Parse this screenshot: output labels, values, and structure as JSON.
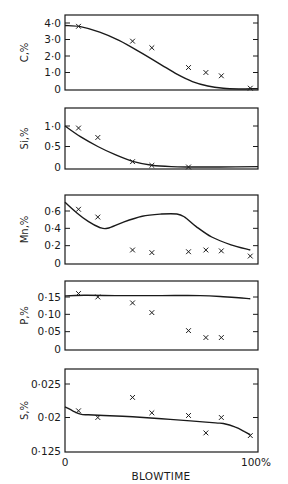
{
  "figure": {
    "x_axis": {
      "label": "BLOWTIME",
      "tick_labels": [
        "0",
        "100%"
      ],
      "range": [
        0,
        100
      ]
    }
  },
  "chart_data": [
    {
      "type": "line",
      "title": "",
      "ylabel": "C,%",
      "xlabel": "BLOWTIME",
      "ylim": [
        0,
        4.3
      ],
      "yticks": [
        0,
        1.0,
        2.0,
        3.0,
        4.0
      ],
      "ytick_labels": [
        "0",
        "1·0",
        "2·0",
        "3·0",
        "4·0"
      ],
      "series": [
        {
          "name": "calculated",
          "style": "line",
          "x": [
            0,
            8,
            18,
            28,
            38,
            48,
            58,
            66,
            74,
            82,
            90,
            100
          ],
          "y": [
            3.85,
            3.78,
            3.45,
            2.95,
            2.3,
            1.6,
            0.9,
            0.45,
            0.18,
            0.04,
            0.0,
            0.02
          ]
        },
        {
          "name": "measured",
          "style": "marker-x",
          "x": [
            7,
            35,
            45,
            64,
            73,
            81,
            96
          ],
          "y": [
            3.8,
            2.9,
            2.5,
            1.3,
            1.0,
            0.8,
            0.05
          ]
        }
      ]
    },
    {
      "type": "line",
      "title": "",
      "ylabel": "Si,%",
      "xlabel": "BLOWTIME",
      "ylim": [
        0,
        1.45
      ],
      "yticks": [
        0,
        0.5,
        1.0
      ],
      "ytick_labels": [
        "0",
        "0·5",
        "1·0"
      ],
      "series": [
        {
          "name": "calculated",
          "style": "line",
          "x": [
            0,
            8,
            17,
            26,
            35,
            45,
            55,
            65,
            80,
            100
          ],
          "y": [
            1.0,
            0.74,
            0.5,
            0.3,
            0.14,
            0.045,
            0.01,
            0.0,
            0.0,
            0.01
          ]
        },
        {
          "name": "measured",
          "style": "marker-x",
          "x": [
            7,
            17,
            35,
            45,
            64
          ],
          "y": [
            0.95,
            0.72,
            0.13,
            0.04,
            0.0
          ]
        }
      ]
    },
    {
      "type": "line",
      "title": "",
      "ylabel": "Mn,%",
      "xlabel": "BLOWTIME",
      "ylim": [
        0,
        0.78
      ],
      "yticks": [
        0,
        0.2,
        0.4,
        0.6
      ],
      "ytick_labels": [
        "0",
        "0·2",
        "0·4",
        "0·6"
      ],
      "series": [
        {
          "name": "calculated",
          "style": "line",
          "x": [
            0,
            6,
            12,
            18,
            22,
            30,
            40,
            50,
            58,
            62,
            68,
            76,
            86,
            96
          ],
          "y": [
            0.7,
            0.58,
            0.48,
            0.41,
            0.4,
            0.47,
            0.54,
            0.565,
            0.565,
            0.53,
            0.42,
            0.3,
            0.21,
            0.15
          ]
        },
        {
          "name": "measured",
          "style": "marker-x",
          "x": [
            7,
            17,
            35,
            45,
            64,
            73,
            81,
            96
          ],
          "y": [
            0.62,
            0.53,
            0.15,
            0.12,
            0.13,
            0.15,
            0.14,
            0.08
          ]
        }
      ]
    },
    {
      "type": "line",
      "title": "",
      "ylabel": "P,%",
      "xlabel": "BLOWTIME",
      "ylim": [
        0,
        0.195
      ],
      "yticks": [
        0,
        0.05,
        0.1,
        0.15
      ],
      "ytick_labels": [
        "0",
        "0·05",
        "0·10",
        "0·15"
      ],
      "series": [
        {
          "name": "calculated",
          "style": "line",
          "x": [
            0,
            10,
            30,
            50,
            70,
            82,
            90,
            96
          ],
          "y": [
            0.153,
            0.155,
            0.154,
            0.154,
            0.154,
            0.151,
            0.148,
            0.145
          ]
        },
        {
          "name": "measured",
          "style": "marker-x",
          "x": [
            7,
            17,
            35,
            45,
            64,
            73,
            81
          ],
          "y": [
            0.16,
            0.15,
            0.133,
            0.105,
            0.053,
            0.033,
            0.033
          ]
        }
      ]
    },
    {
      "type": "line",
      "title": "",
      "ylabel": "S,%",
      "xlabel": "BLOWTIME",
      "ylim": [
        0.015,
        0.0272
      ],
      "yticks": [
        0.015,
        0.02,
        0.025
      ],
      "ytick_labels": [
        "0·125",
        "0·02",
        "0·025"
      ],
      "series": [
        {
          "name": "calculated",
          "style": "line",
          "x": [
            0,
            4,
            8,
            12,
            20,
            35,
            50,
            65,
            78,
            82,
            88,
            93,
            96
          ],
          "y": [
            0.0216,
            0.021,
            0.0205,
            0.0204,
            0.0203,
            0.0201,
            0.0198,
            0.0195,
            0.0192,
            0.0191,
            0.0186,
            0.0179,
            0.0174
          ]
        },
        {
          "name": "measured",
          "style": "marker-x",
          "x": [
            7,
            17,
            35,
            45,
            64,
            73,
            81,
            96
          ],
          "y": [
            0.021,
            0.02,
            0.023,
            0.0207,
            0.0203,
            0.0177,
            0.02,
            0.0173
          ]
        }
      ]
    }
  ],
  "layout": {
    "plot_left": 65,
    "plot_right": 258,
    "panels": [
      {
        "top": 15,
        "bottom": 90,
        "y_at_min": 89,
        "y_at_max_tick": 23
      },
      {
        "top": 108,
        "bottom": 169,
        "y_at_min": 167,
        "y_at_max_tick": 126
      },
      {
        "top": 195,
        "bottom": 264,
        "y_at_min": 263,
        "y_at_max_tick": 211
      },
      {
        "top": 281,
        "bottom": 350,
        "y_at_min": 349,
        "y_at_max_tick": 297
      },
      {
        "top": 369,
        "bottom": 452,
        "y_at_min": 451,
        "y_at_max_tick": 384
      }
    ],
    "line_color": "#1a1a1a",
    "background": "#ffffff"
  }
}
